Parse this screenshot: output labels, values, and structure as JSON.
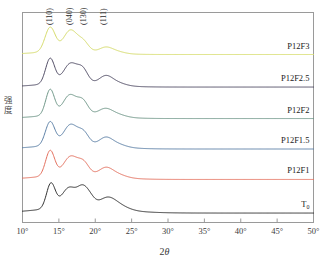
{
  "chart_data": {
    "type": "line",
    "title": "",
    "xlabel": "2θ",
    "ylabel": "强度",
    "xlim": [
      10,
      50
    ],
    "ylim": [
      0,
      1
    ],
    "grid": false,
    "legend_position": "inline-right",
    "xticks": [
      "10°",
      "15°",
      "20°",
      "25°",
      "30°",
      "35°",
      "40°",
      "45°",
      "50°"
    ],
    "xtick_values": [
      10,
      15,
      20,
      25,
      30,
      35,
      40,
      45,
      50
    ],
    "yticks": [],
    "annotations": [
      {
        "text": "(110)",
        "x": 13.8,
        "note": "peak index label"
      },
      {
        "text": "(040)",
        "x": 16.6,
        "note": "peak index label"
      },
      {
        "text": "(130)",
        "x": 18.5,
        "note": "peak index label"
      },
      {
        "text": "(111)",
        "x": 21.3,
        "note": "peak index label"
      }
    ],
    "series": [
      {
        "name": "P12F3",
        "color": "#d6dc6a",
        "offset": 0.8,
        "peaks": [
          {
            "x": 13.8,
            "h": 0.115,
            "w": 0.7
          },
          {
            "x": 16.6,
            "h": 0.098,
            "w": 0.95
          },
          {
            "x": 18.4,
            "h": 0.04,
            "w": 0.7
          },
          {
            "x": 21.4,
            "h": 0.02,
            "w": 0.85
          },
          {
            "x": 22.6,
            "h": 0.012,
            "w": 1.2
          }
        ],
        "baseline_bump": {
          "x": 16.5,
          "h": 0.018,
          "w": 4.0
        }
      },
      {
        "name": "P12F2.5",
        "color": "#4e4a63",
        "offset": 0.645,
        "peaks": [
          {
            "x": 13.8,
            "h": 0.12,
            "w": 0.62
          },
          {
            "x": 16.6,
            "h": 0.09,
            "w": 0.95
          },
          {
            "x": 18.3,
            "h": 0.058,
            "w": 0.7
          },
          {
            "x": 21.4,
            "h": 0.03,
            "w": 0.85
          },
          {
            "x": 22.5,
            "h": 0.018,
            "w": 1.3
          }
        ],
        "baseline_bump": {
          "x": 17.0,
          "h": 0.022,
          "w": 4.2
        }
      },
      {
        "name": "P12F2",
        "color": "#6e9687",
        "offset": 0.495,
        "peaks": [
          {
            "x": 13.8,
            "h": 0.122,
            "w": 0.6
          },
          {
            "x": 16.5,
            "h": 0.09,
            "w": 0.92
          },
          {
            "x": 18.3,
            "h": 0.06,
            "w": 0.72
          },
          {
            "x": 21.3,
            "h": 0.026,
            "w": 0.9
          },
          {
            "x": 22.6,
            "h": 0.016,
            "w": 1.3
          }
        ],
        "baseline_bump": {
          "x": 17.0,
          "h": 0.022,
          "w": 4.2
        }
      },
      {
        "name": "P12F1.5",
        "color": "#5b7fa6",
        "offset": 0.35,
        "peaks": [
          {
            "x": 13.8,
            "h": 0.112,
            "w": 0.65
          },
          {
            "x": 16.6,
            "h": 0.092,
            "w": 0.95
          },
          {
            "x": 18.4,
            "h": 0.052,
            "w": 0.72
          },
          {
            "x": 21.4,
            "h": 0.03,
            "w": 0.85
          },
          {
            "x": 22.6,
            "h": 0.018,
            "w": 1.3
          }
        ],
        "baseline_bump": {
          "x": 17.2,
          "h": 0.024,
          "w": 4.4
        }
      },
      {
        "name": "P12F1",
        "color": "#e4705e",
        "offset": 0.205,
        "peaks": [
          {
            "x": 13.8,
            "h": 0.12,
            "w": 0.62
          },
          {
            "x": 16.6,
            "h": 0.085,
            "w": 0.95
          },
          {
            "x": 18.4,
            "h": 0.055,
            "w": 0.75
          },
          {
            "x": 21.4,
            "h": 0.032,
            "w": 0.9
          },
          {
            "x": 22.7,
            "h": 0.018,
            "w": 1.3
          }
        ],
        "baseline_bump": {
          "x": 17.2,
          "h": 0.024,
          "w": 4.4
        }
      },
      {
        "name": "T₀",
        "color": "#2d2d2d",
        "offset": 0.045,
        "peaks": [
          {
            "x": 13.9,
            "h": 0.118,
            "w": 0.6
          },
          {
            "x": 16.4,
            "h": 0.092,
            "w": 1.0
          },
          {
            "x": 18.2,
            "h": 0.07,
            "w": 0.7
          },
          {
            "x": 19.2,
            "h": 0.045,
            "w": 0.7
          },
          {
            "x": 21.6,
            "h": 0.04,
            "w": 1.1
          },
          {
            "x": 23.0,
            "h": 0.022,
            "w": 1.4
          }
        ],
        "baseline_bump": {
          "x": 17.8,
          "h": 0.03,
          "w": 5.0
        }
      }
    ]
  },
  "axis": {
    "frame_color": "#9a9a9a",
    "tick_color": "#9a9a9a"
  },
  "labels": {
    "t0_base": "T",
    "t0_sub": "0"
  }
}
